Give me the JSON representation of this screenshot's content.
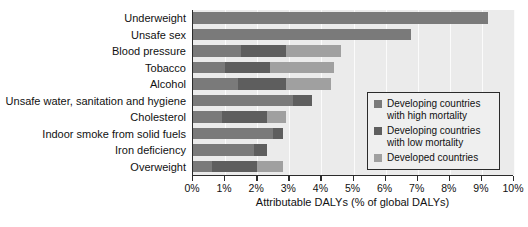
{
  "chart_data": {
    "type": "bar",
    "orientation": "horizontal",
    "stacked": true,
    "title": "",
    "xlabel": "Attributable DALYs (% of global DALYs)",
    "ylabel": "",
    "xlim": [
      0,
      10
    ],
    "xtick_labels": [
      "0%",
      "1%",
      "2%",
      "3%",
      "4%",
      "5%",
      "6%",
      "7%",
      "8%",
      "9%",
      "10%"
    ],
    "xticks": [
      0,
      1,
      2,
      3,
      4,
      5,
      6,
      7,
      8,
      9,
      10
    ],
    "grid": true,
    "legend_position": "center-right",
    "categories": [
      "Underweight",
      "Unsafe sex",
      "Blood pressure",
      "Tobacco",
      "Alcohol",
      "Unsafe water, sanitation and hygiene",
      "Cholesterol",
      "Indoor smoke from solid fuels",
      "Iron deficiency",
      "Overweight"
    ],
    "series": [
      {
        "name": "Developing countries with high mortality",
        "color": "#7a7a7a",
        "values": [
          9.2,
          6.8,
          1.5,
          1.0,
          1.4,
          3.1,
          0.9,
          2.5,
          1.9,
          0.6
        ]
      },
      {
        "name": "Developing countries with low mortality",
        "color": "#5e5e5e",
        "values": [
          0.0,
          0.0,
          1.4,
          1.4,
          1.5,
          0.6,
          1.4,
          0.3,
          0.4,
          1.4
        ]
      },
      {
        "name": "Developed countries",
        "color": "#a0a0a0",
        "values": [
          0.0,
          0.0,
          1.7,
          2.0,
          1.4,
          0.0,
          0.6,
          0.0,
          0.0,
          0.8
        ]
      }
    ],
    "totals": [
      9.2,
      6.8,
      4.6,
      4.4,
      4.3,
      3.7,
      2.9,
      2.8,
      2.3,
      2.8
    ]
  },
  "legend": {
    "entries": [
      {
        "label_line1": "Developing countries",
        "label_line2": "with high mortality"
      },
      {
        "label_line1": "Developing countries",
        "label_line2": "with low mortality"
      },
      {
        "label_line1": "Developed countries",
        "label_line2": ""
      }
    ]
  }
}
